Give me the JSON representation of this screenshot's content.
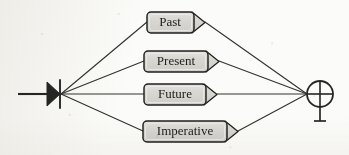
{
  "figure": {
    "kind": "transition-network-diagram",
    "medium": "scanned-page",
    "background_color": "#fbfbf9",
    "ink_color": "#262624",
    "node_fill_color": "#d6d5d1",
    "node_highlight_color": "#eceae6",
    "node_border_color": "#1f1f1e",
    "edge_color": "#33332f",
    "width": 349,
    "height": 155
  },
  "start_marker": {
    "name": "start-triangle",
    "symbol": "filled-triangle-with-bar",
    "entry_line": {
      "x1": 18,
      "x2": 47,
      "y": 94
    },
    "triangle": {
      "x": 47,
      "y_top": 82,
      "y_bottom": 106,
      "apex_x": 60
    },
    "bar": {
      "x": 60,
      "y_top": 80,
      "y_bottom": 108
    }
  },
  "end_marker": {
    "name": "end-circle-plus",
    "symbol": "circled-plus",
    "glyph": "⊕",
    "circle": {
      "cx": 320,
      "cy": 94,
      "r": 13
    },
    "stem": {
      "x": 320,
      "y1": 107,
      "y2": 121
    },
    "foot": {
      "x1": 314,
      "x2": 326,
      "y": 121
    }
  },
  "nodes": [
    {
      "id": "past",
      "label": "Past",
      "box": {
        "x": 147,
        "y": 12,
        "w": 47,
        "h": 21
      },
      "tab_w": 11,
      "label_x": 170,
      "label_y": 23
    },
    {
      "id": "present",
      "label": "Present",
      "box": {
        "x": 144,
        "y": 51,
        "w": 64,
        "h": 21
      },
      "tab_w": 11,
      "label_x": 176,
      "label_y": 62
    },
    {
      "id": "future",
      "label": "Future",
      "box": {
        "x": 144,
        "y": 84,
        "w": 62,
        "h": 21
      },
      "tab_w": 11,
      "label_x": 175,
      "label_y": 95
    },
    {
      "id": "imperative",
      "label": "Imperative",
      "box": {
        "x": 143,
        "y": 121,
        "w": 84,
        "h": 21
      },
      "tab_w": 11,
      "label_x": 185,
      "label_y": 132
    }
  ],
  "edges": [
    {
      "id": "start-to-past",
      "from": "start",
      "to": "past",
      "x1": 61,
      "y1": 94,
      "x2": 147,
      "y2": 22
    },
    {
      "id": "start-to-present",
      "from": "start",
      "to": "present",
      "x1": 61,
      "y1": 94,
      "x2": 144,
      "y2": 61
    },
    {
      "id": "start-to-future",
      "from": "start",
      "to": "future",
      "x1": 61,
      "y1": 94,
      "x2": 144,
      "y2": 94
    },
    {
      "id": "start-to-imperative",
      "from": "start",
      "to": "imperative",
      "x1": 61,
      "y1": 94,
      "x2": 143,
      "y2": 131
    },
    {
      "id": "past-to-end",
      "from": "past",
      "to": "end",
      "x1": 205,
      "y1": 22,
      "x2": 307,
      "y2": 94
    },
    {
      "id": "present-to-end",
      "from": "present",
      "to": "end",
      "x1": 219,
      "y1": 61,
      "x2": 307,
      "y2": 94
    },
    {
      "id": "future-to-end",
      "from": "future",
      "to": "end",
      "x1": 217,
      "y1": 94,
      "x2": 307,
      "y2": 94
    },
    {
      "id": "imperative-to-end",
      "from": "imperative",
      "to": "end",
      "x1": 238,
      "y1": 131,
      "x2": 307,
      "y2": 94
    }
  ]
}
